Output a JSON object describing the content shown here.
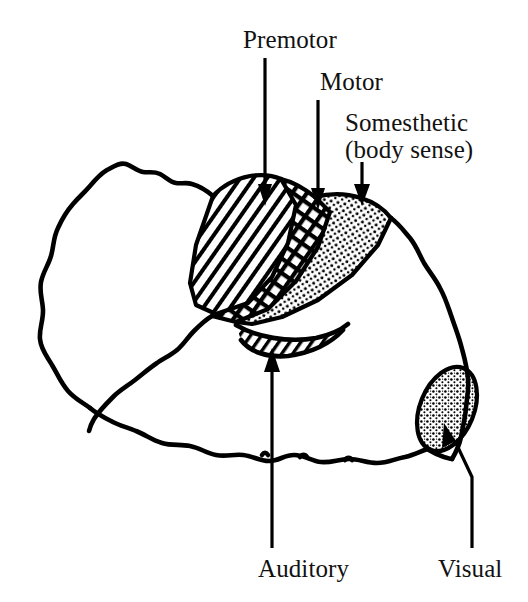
{
  "figure": {
    "background_color": "#ffffff",
    "ink_color": "#000000",
    "width": 528,
    "height": 602
  },
  "labels": {
    "premotor": "Premotor",
    "motor": "Motor",
    "somesthetic_line1": "Somesthetic",
    "somesthetic_line2": "(body sense)",
    "auditory": "Auditory",
    "visual": "Visual"
  },
  "regions": [
    {
      "id": "premotor",
      "label": "Premotor",
      "pattern": "diagonal-hatch",
      "description": "Diagonally hatched strip on the anterior side of the central sulcus"
    },
    {
      "id": "motor",
      "label": "Motor",
      "pattern": "cross-hatch",
      "description": "Cross-hatched strip along the precentral gyrus"
    },
    {
      "id": "somesthetic",
      "label": "Somesthetic (body sense)",
      "pattern": "stipple",
      "description": "Stippled strip along the postcentral gyrus"
    },
    {
      "id": "auditory",
      "label": "Auditory",
      "pattern": "diagonal-hatch",
      "description": "Diagonally hatched lens-shaped area inside the lateral sulcus on the temporal lobe"
    },
    {
      "id": "visual",
      "label": "Visual",
      "pattern": "stipple",
      "description": "Stippled oval at the occipital pole"
    }
  ],
  "leaders": [
    {
      "id": "premotor",
      "direction": "down",
      "target_region": "premotor"
    },
    {
      "id": "motor",
      "direction": "down",
      "target_region": "motor"
    },
    {
      "id": "somesthetic",
      "direction": "down",
      "target_region": "somesthetic"
    },
    {
      "id": "auditory",
      "direction": "up",
      "target_region": "auditory"
    },
    {
      "id": "visual",
      "direction": "up-left",
      "target_region": "visual"
    }
  ]
}
